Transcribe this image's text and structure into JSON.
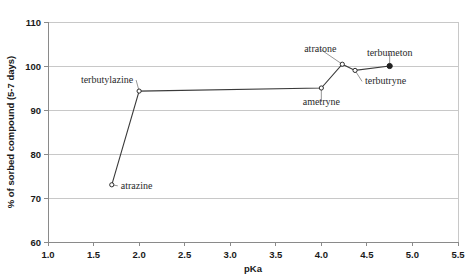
{
  "chart_data": {
    "type": "scatter",
    "title": "",
    "xlabel": "pKa",
    "ylabel": "% of sorbed compound (5-7 days)",
    "xlim": [
      1.0,
      5.5
    ],
    "ylim": [
      60,
      110
    ],
    "grid": "horizontal",
    "legend": "none",
    "xticks": [
      "1.0",
      "1.5",
      "2.0",
      "2.5",
      "3.0",
      "3.5",
      "4.0",
      "4.5",
      "5.0",
      "5.5"
    ],
    "xtick_values": [
      1.0,
      1.5,
      2.0,
      2.5,
      3.0,
      3.5,
      4.0,
      4.5,
      5.0,
      5.5
    ],
    "yticks": [
      "60",
      "70",
      "80",
      "90",
      "100",
      "110"
    ],
    "ytick_values": [
      60,
      70,
      80,
      90,
      100,
      110
    ],
    "points": [
      {
        "label": "atrazine",
        "x": 1.7,
        "y": 73.0,
        "marker": "open",
        "label_dx": 9,
        "label_dy": 4,
        "label_anchor": "start"
      },
      {
        "label": "terbutylazine",
        "x": 2.0,
        "y": 94.3,
        "marker": "open",
        "label_dx": -6,
        "label_dy": -8,
        "label_anchor": "end"
      },
      {
        "label": "ametryne",
        "x": 4.0,
        "y": 95.0,
        "marker": "open",
        "label_dx": 0,
        "label_dy": 17,
        "label_anchor": "middle"
      },
      {
        "label": "atratone",
        "x": 4.23,
        "y": 100.4,
        "marker": "open",
        "label_dx": -22,
        "label_dy": -12,
        "label_anchor": "middle"
      },
      {
        "label": "terbutryne",
        "x": 4.37,
        "y": 99.0,
        "marker": "open",
        "label_dx": 10,
        "label_dy": 14,
        "label_anchor": "start"
      },
      {
        "label": "terbumeton",
        "x": 4.75,
        "y": 100.0,
        "marker": "filled",
        "label_dx": 0,
        "label_dy": -10,
        "label_anchor": "middle"
      }
    ],
    "series": [
      {
        "name": "sorption-series",
        "x": [
          1.7,
          2.0,
          4.0,
          4.23,
          4.37,
          4.75
        ],
        "values": [
          73.0,
          94.3,
          95.0,
          100.4,
          99.0,
          100.0
        ]
      }
    ]
  }
}
